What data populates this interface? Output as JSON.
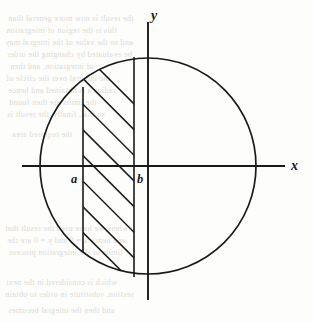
{
  "figure": {
    "caption": "",
    "background_color": "#fdfdfc",
    "stroke_color": "#1a1a1a"
  },
  "chart_data": {
    "type": "diagram",
    "title": "",
    "subtitle": "",
    "xlabel": "x",
    "ylabel": "y",
    "grid": false,
    "legend": false,
    "axes": {
      "x_axis_label": "x",
      "y_axis_label": "y",
      "x_axis_from": [
        22,
        166
      ],
      "x_axis_to": [
        285,
        166
      ],
      "y_axis_from": [
        148,
        22
      ],
      "y_axis_to": [
        148,
        300
      ],
      "origin": [
        148,
        166
      ]
    },
    "circle": {
      "center": [
        148,
        166
      ],
      "radius": 108,
      "filled": false
    },
    "vertical_lines": [
      {
        "name": "a",
        "x": 83,
        "y_top": 87,
        "y_bottom": 252,
        "label": "a",
        "label_x": 71,
        "label_y": 172
      },
      {
        "name": "b",
        "x": 134,
        "y_top": 57,
        "y_bottom": 277,
        "label": "b",
        "label_x": 137,
        "label_y": 172
      }
    ],
    "hatching": {
      "angle_degrees": -45,
      "count": 7,
      "region_x_from": 83,
      "region_x_to": 134
    },
    "annotations": [
      {
        "text": "y",
        "x": 151,
        "y": 8,
        "style": "italic"
      },
      {
        "text": "x",
        "x": 291,
        "y": 158,
        "style": "italic"
      },
      {
        "text": "a",
        "x": 71,
        "y": 172,
        "style": "italic"
      },
      {
        "text": "b",
        "x": 137,
        "y": 172,
        "style": "italic"
      }
    ]
  },
  "labels": {
    "y_axis": "y",
    "x_axis": "x",
    "point_a": "a",
    "point_b": "b"
  },
  "background_text": {
    "note": "faint mirrored show-through text from the reverse side of the scanned page",
    "lines": [
      {
        "text": "the result is now more general than",
        "x": 8,
        "y": 14
      },
      {
        "text": "this is the region of integration",
        "x": 6,
        "y": 26
      },
      {
        "text": "and so the value of the integral may",
        "x": 5,
        "y": 38
      },
      {
        "text": "be evaluated by changing the order",
        "x": 7,
        "y": 50
      },
      {
        "text": "of integration, and then",
        "x": 10,
        "y": 62
      },
      {
        "text": "the integral over the circle of",
        "x": 6,
        "y": 74
      },
      {
        "text": "radius a is obtained and hence",
        "x": 8,
        "y": 86
      },
      {
        "text": "the limits are then found",
        "x": 9,
        "y": 98
      },
      {
        "text": "so that, finally, the result is",
        "x": 7,
        "y": 110
      },
      {
        "text": "the required area",
        "x": 12,
        "y": 130
      },
      {
        "text": "where we have used the result that",
        "x": 5,
        "y": 224
      },
      {
        "text": "and hence x = 0 and y = 0 are the",
        "x": 7,
        "y": 236
      },
      {
        "text": "limits of the integration process",
        "x": 9,
        "y": 248
      },
      {
        "text": "which is considered in the next",
        "x": 6,
        "y": 278
      },
      {
        "text": "section, substitute in order to obtain",
        "x": 5,
        "y": 290
      },
      {
        "text": "and then the integral becomes",
        "x": 8,
        "y": 306
      }
    ]
  }
}
